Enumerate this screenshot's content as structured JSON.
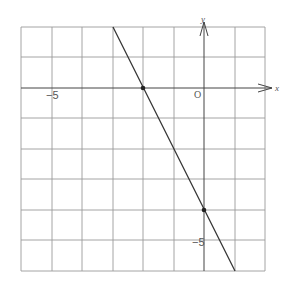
{
  "diagram": {
    "type": "coordinate-plane-line-graph",
    "axes": {
      "x_label": "x",
      "y_label": "y",
      "origin_label": "O"
    },
    "tick_labels": {
      "x_neg5": "−5",
      "y_neg5": "−5"
    },
    "grid": {
      "x_range": [
        -6,
        2
      ],
      "y_range": [
        -6,
        2
      ],
      "cell": 1
    },
    "line": {
      "equation": "y = -2x - 4",
      "slope": -2,
      "intercept": -4
    },
    "marked_points": [
      {
        "x": -2,
        "y": 0
      },
      {
        "x": 0,
        "y": -4
      }
    ]
  }
}
